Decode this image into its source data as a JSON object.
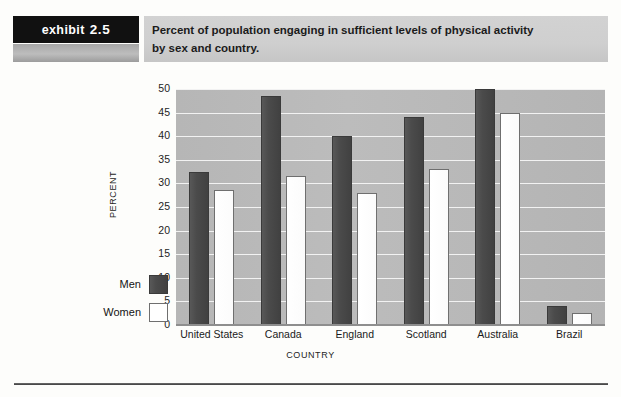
{
  "exhibit": {
    "tag_word": "exhibit",
    "tag_number": "2.5",
    "title_line1": "Percent of population engaging in sufficient levels of physical activity",
    "title_line2": "by sex and country."
  },
  "legend": {
    "items": [
      {
        "label": "Men",
        "swatch": "men-swatch",
        "color": "#4b4b4b"
      },
      {
        "label": "Women",
        "swatch": "women-swatch",
        "color": "#ffffff"
      }
    ]
  },
  "chart_data": {
    "type": "bar",
    "title": "Percent of population engaging in sufficient levels of physical activity by sex and country.",
    "xlabel": "COUNTRY",
    "ylabel": "PERCENT",
    "ylim": [
      0,
      50
    ],
    "ytick_step": 5,
    "yticks": [
      "50",
      "45",
      "40",
      "35",
      "30",
      "25",
      "20",
      "15",
      "10",
      "5",
      "0"
    ],
    "grid": true,
    "legend_position": "left-outside",
    "categories": [
      "United States",
      "Canada",
      "England",
      "Scotland",
      "Australia",
      "Brazil"
    ],
    "series": [
      {
        "name": "Men",
        "color": "#4b4b4b",
        "values": [
          32.5,
          48.5,
          40,
          44,
          50,
          4
        ]
      },
      {
        "name": "Women",
        "color": "#ffffff",
        "values": [
          28.5,
          31.5,
          28,
          33,
          45,
          2.5
        ]
      }
    ]
  }
}
